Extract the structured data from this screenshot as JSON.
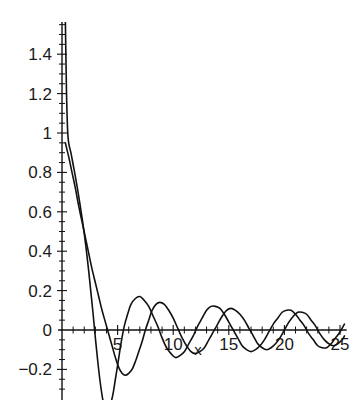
{
  "chart_data": {
    "type": "line",
    "title": "",
    "subtitle": "",
    "xlabel": "x",
    "ylabel": "",
    "xlim": [
      -0.35,
      25.6
    ],
    "ylim": [
      -0.33,
      1.58
    ],
    "grid": false,
    "legend": "none",
    "background": "#ffffff",
    "line_color": "#111111",
    "xticks": [
      5,
      10,
      15,
      20,
      25
    ],
    "xtick_labels": [
      "5",
      "10",
      "15",
      "20",
      "25"
    ],
    "xtick_minor_step": 1,
    "yticks": [
      -0.2,
      0,
      0.2,
      0.4,
      0.6,
      0.8,
      1,
      1.2,
      1.4
    ],
    "ytick_labels": [
      "-0.2",
      "0",
      "0.2",
      "0.4",
      "0.6",
      "0.8",
      "1",
      "1.2",
      "1.4"
    ],
    "ytick_minor_step": 0.05,
    "annotations": [],
    "series": [
      {
        "name": "curve-1",
        "description": "damped oscillation, steep descent from above plot top near x=0, first minimum approx -0.40 near x=3.8",
        "points": [
          [
            0.3,
            1.58
          ],
          [
            0.4,
            1.22
          ],
          [
            0.5,
            1.02
          ],
          [
            0.6,
            0.95
          ],
          [
            0.8,
            0.9
          ],
          [
            1.0,
            0.84
          ],
          [
            1.2,
            0.78
          ],
          [
            1.5,
            0.68
          ],
          [
            1.8,
            0.57
          ],
          [
            2.0,
            0.49
          ],
          [
            2.2,
            0.4
          ],
          [
            2.4,
            0.3
          ],
          [
            2.6,
            0.19
          ],
          [
            2.8,
            0.08
          ],
          [
            3.0,
            -0.04
          ],
          [
            3.2,
            -0.15
          ],
          [
            3.4,
            -0.25
          ],
          [
            3.6,
            -0.33
          ],
          [
            3.8,
            -0.39
          ],
          [
            4.0,
            -0.41
          ],
          [
            4.2,
            -0.4
          ],
          [
            4.4,
            -0.37
          ],
          [
            4.6,
            -0.32
          ],
          [
            4.8,
            -0.25
          ],
          [
            5.0,
            -0.18
          ],
          [
            5.3,
            -0.07
          ],
          [
            5.6,
            0.02
          ],
          [
            5.9,
            0.08
          ],
          [
            6.2,
            0.13
          ],
          [
            6.6,
            0.16
          ],
          [
            7.0,
            0.17
          ],
          [
            7.4,
            0.15
          ],
          [
            7.8,
            0.12
          ],
          [
            8.2,
            0.07
          ],
          [
            8.6,
            0.02
          ],
          [
            9.0,
            -0.04
          ],
          [
            9.4,
            -0.09
          ],
          [
            9.8,
            -0.12
          ],
          [
            10.2,
            -0.14
          ],
          [
            10.6,
            -0.13
          ],
          [
            11.0,
            -0.11
          ],
          [
            11.4,
            -0.07
          ],
          [
            11.8,
            -0.03
          ],
          [
            12.2,
            0.02
          ],
          [
            12.6,
            0.06
          ],
          [
            13.0,
            0.1
          ],
          [
            13.4,
            0.12
          ],
          [
            13.8,
            0.12
          ],
          [
            14.2,
            0.11
          ],
          [
            14.6,
            0.08
          ],
          [
            15.0,
            0.04
          ],
          [
            15.4,
            0.0
          ],
          [
            15.8,
            -0.04
          ],
          [
            16.2,
            -0.08
          ],
          [
            16.6,
            -0.1
          ],
          [
            17.0,
            -0.11
          ],
          [
            17.4,
            -0.1
          ],
          [
            17.8,
            -0.08
          ],
          [
            18.2,
            -0.05
          ],
          [
            18.6,
            -0.01
          ],
          [
            19.0,
            0.03
          ],
          [
            19.4,
            0.06
          ],
          [
            19.8,
            0.09
          ],
          [
            20.2,
            0.1
          ],
          [
            20.6,
            0.1
          ],
          [
            21.0,
            0.08
          ],
          [
            21.4,
            0.05
          ],
          [
            21.8,
            0.02
          ],
          [
            22.2,
            -0.02
          ],
          [
            22.6,
            -0.05
          ],
          [
            23.0,
            -0.08
          ],
          [
            23.4,
            -0.09
          ],
          [
            23.8,
            -0.09
          ],
          [
            24.2,
            -0.07
          ],
          [
            24.6,
            -0.04
          ],
          [
            25.0,
            -0.01
          ],
          [
            25.4,
            0.03
          ]
        ]
      },
      {
        "name": "curve-2",
        "description": "damped oscillation, starts near 0.95 at x=0.3, first minimum approx -0.23 near x=5.3, phase-shifted relative to curve-1",
        "points": [
          [
            0.3,
            0.95
          ],
          [
            0.6,
            0.88
          ],
          [
            0.9,
            0.8
          ],
          [
            1.2,
            0.72
          ],
          [
            1.5,
            0.63
          ],
          [
            1.8,
            0.55
          ],
          [
            2.1,
            0.47
          ],
          [
            2.4,
            0.39
          ],
          [
            2.7,
            0.31
          ],
          [
            3.0,
            0.24
          ],
          [
            3.3,
            0.17
          ],
          [
            3.6,
            0.1
          ],
          [
            3.9,
            0.04
          ],
          [
            4.2,
            -0.02
          ],
          [
            4.5,
            -0.08
          ],
          [
            4.8,
            -0.14
          ],
          [
            5.1,
            -0.19
          ],
          [
            5.4,
            -0.22
          ],
          [
            5.7,
            -0.23
          ],
          [
            6.0,
            -0.22
          ],
          [
            6.3,
            -0.2
          ],
          [
            6.6,
            -0.16
          ],
          [
            6.9,
            -0.11
          ],
          [
            7.2,
            -0.06
          ],
          [
            7.5,
            0.0
          ],
          [
            7.8,
            0.05
          ],
          [
            8.1,
            0.1
          ],
          [
            8.45,
            0.13
          ],
          [
            8.8,
            0.14
          ],
          [
            9.2,
            0.13
          ],
          [
            9.6,
            0.1
          ],
          [
            10.0,
            0.06
          ],
          [
            10.4,
            0.01
          ],
          [
            10.8,
            -0.04
          ],
          [
            11.2,
            -0.08
          ],
          [
            11.6,
            -0.11
          ],
          [
            12.0,
            -0.12
          ],
          [
            12.4,
            -0.11
          ],
          [
            12.8,
            -0.09
          ],
          [
            13.2,
            -0.05
          ],
          [
            13.6,
            -0.01
          ],
          [
            14.0,
            0.03
          ],
          [
            14.4,
            0.07
          ],
          [
            14.8,
            0.1
          ],
          [
            15.2,
            0.11
          ],
          [
            15.6,
            0.1
          ],
          [
            16.0,
            0.08
          ],
          [
            16.4,
            0.05
          ],
          [
            16.8,
            0.01
          ],
          [
            17.2,
            -0.03
          ],
          [
            17.6,
            -0.07
          ],
          [
            18.0,
            -0.09
          ],
          [
            18.4,
            -0.1
          ],
          [
            18.8,
            -0.09
          ],
          [
            19.2,
            -0.07
          ],
          [
            19.6,
            -0.04
          ],
          [
            20.0,
            0.0
          ],
          [
            20.4,
            0.04
          ],
          [
            20.8,
            0.07
          ],
          [
            21.2,
            0.09
          ],
          [
            21.6,
            0.09
          ],
          [
            22.0,
            0.08
          ],
          [
            22.4,
            0.05
          ],
          [
            22.8,
            0.02
          ],
          [
            23.2,
            -0.02
          ],
          [
            23.6,
            -0.05
          ],
          [
            24.0,
            -0.07
          ],
          [
            24.4,
            -0.08
          ],
          [
            24.8,
            -0.07
          ],
          [
            25.2,
            -0.05
          ],
          [
            25.4,
            -0.03
          ]
        ]
      }
    ]
  }
}
